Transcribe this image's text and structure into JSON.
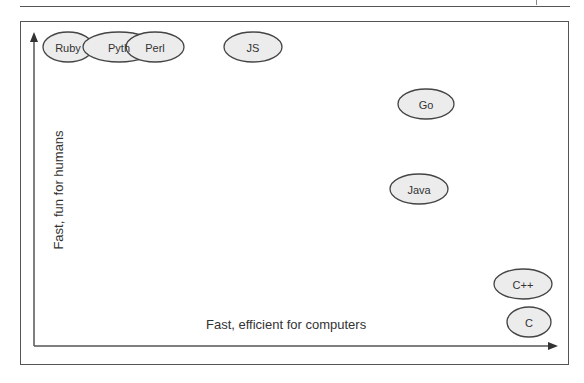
{
  "diagram": {
    "x_axis_label": "Fast, efficient for computers",
    "y_axis_label": "Fast, fun for humans",
    "languages": [
      {
        "name": "Ruby",
        "label": "Ruby",
        "cx": 68,
        "cy": 47,
        "rx": 25,
        "ry": 15
      },
      {
        "name": "Python",
        "label": "Pyth",
        "cx": 119,
        "cy": 47,
        "rx": 36,
        "ry": 15
      },
      {
        "name": "Perl",
        "label": "Perl",
        "cx": 155,
        "cy": 47,
        "rx": 29,
        "ry": 15
      },
      {
        "name": "JS",
        "label": "JS",
        "cx": 253,
        "cy": 47,
        "rx": 29,
        "ry": 15
      },
      {
        "name": "Go",
        "label": "Go",
        "cx": 426,
        "cy": 104,
        "rx": 28,
        "ry": 15
      },
      {
        "name": "Java",
        "label": "Java",
        "cx": 419,
        "cy": 189,
        "rx": 29,
        "ry": 15
      },
      {
        "name": "C++",
        "label": "C++",
        "cx": 523,
        "cy": 284,
        "rx": 29,
        "ry": 15
      },
      {
        "name": "C",
        "label": "C",
        "cx": 529,
        "cy": 322,
        "rx": 22,
        "ry": 15
      }
    ],
    "colors": {
      "fill": "#ececec",
      "stroke": "#444444",
      "axis": "#333333"
    }
  }
}
